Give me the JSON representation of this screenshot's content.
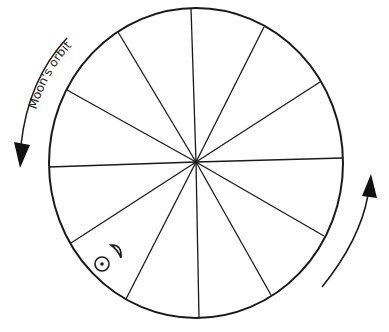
{
  "diagram": {
    "type": "zodiac-wheel",
    "segments": 12,
    "labels": {
      "moon_orbit": "Moon's orbit"
    },
    "symbols": {
      "sun": "sun-symbol",
      "moon": "crescent-moon-symbol"
    },
    "arrows": [
      {
        "name": "moon-orbit-arrow",
        "direction": "counterclockwise"
      },
      {
        "name": "rotation-arrow",
        "direction": "counterclockwise"
      }
    ],
    "colors": {
      "line": "#1a1a1a",
      "background": "#ffffff"
    }
  }
}
